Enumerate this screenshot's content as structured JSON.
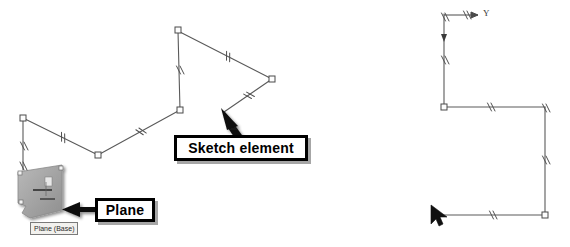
{
  "figure": {
    "background_color": "#ffffff",
    "line_color": "#555555",
    "callout_border_color": "#000000",
    "callout_fill_color": "#ffffff"
  },
  "callouts": [
    {
      "id": "sketch-element",
      "label": "Sketch element",
      "points_to": "polyline-segment"
    },
    {
      "id": "plane",
      "label": "Plane",
      "points_to": "plane-glyph"
    }
  ],
  "tooltip": {
    "label": "Plane (Base)"
  },
  "axis": {
    "y_label": "Y"
  },
  "left_sketch": {
    "name": "open-polyline-sketch",
    "vertices": [
      {
        "x": 23,
        "y": 118
      },
      {
        "x": 98,
        "y": 155
      },
      {
        "x": 180,
        "y": 110
      },
      {
        "x": 177,
        "y": 30
      },
      {
        "x": 272,
        "y": 79
      },
      {
        "x": 223,
        "y": 112
      }
    ],
    "tail_vertex": {
      "x": 23,
      "y": 168
    },
    "parallel_marks": [
      {
        "x": 61,
        "y": 137,
        "angle": 26
      },
      {
        "x": 140,
        "y": 133,
        "angle": -29
      },
      {
        "x": 179,
        "y": 70,
        "angle": 0
      },
      {
        "x": 226,
        "y": 55,
        "angle": 27
      },
      {
        "x": 247,
        "y": 95,
        "angle": -34
      },
      {
        "x": 23,
        "y": 145,
        "angle": 0
      }
    ]
  },
  "right_sketch": {
    "name": "right-angle-sketch",
    "vertices": [
      {
        "x": 444,
        "y": 20
      },
      {
        "x": 444,
        "y": 107
      },
      {
        "x": 545,
        "y": 107
      },
      {
        "x": 545,
        "y": 215
      },
      {
        "x": 443,
        "y": 215
      }
    ],
    "parallel_marks": [
      {
        "x": 490,
        "y": 107,
        "angle": 0
      },
      {
        "x": 545,
        "y": 160,
        "angle": 0
      },
      {
        "x": 492,
        "y": 215,
        "angle": 0
      },
      {
        "x": 444,
        "y": 60,
        "angle": 0
      },
      {
        "x": 444,
        "y": 35,
        "angle": 0
      },
      {
        "x": 466,
        "y": 16,
        "angle": 0
      },
      {
        "x": 545,
        "y": 107,
        "angle": 0
      },
      {
        "x": 545,
        "y": 215,
        "angle": 0
      }
    ],
    "cursor": {
      "x": 436,
      "y": 213
    }
  }
}
